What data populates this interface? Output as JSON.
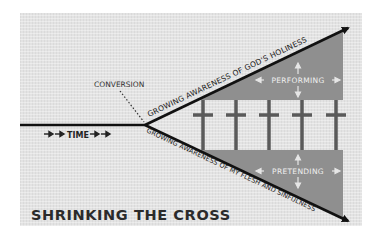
{
  "diagram": {
    "title": "SHRINKING THE CROSS",
    "labels": {
      "conversion": "CONVERSION",
      "time": "TIME",
      "upper_axis": "GROWING AWARENESS OF GOD'S HOLINESS",
      "lower_axis": "GROWING AWARENESS OF MY FLESH AND SINFULNESS",
      "upper_region": "PERFORMING",
      "lower_region": "PRETENDING"
    },
    "cross_count": 5,
    "colors": {
      "background": "#e3e3e3",
      "line": "#111111",
      "region_fill": "#8f8f8f",
      "cross": "#5a5a5a",
      "region_text": "#eeeeee",
      "title_text": "#2b2b2b"
    }
  }
}
